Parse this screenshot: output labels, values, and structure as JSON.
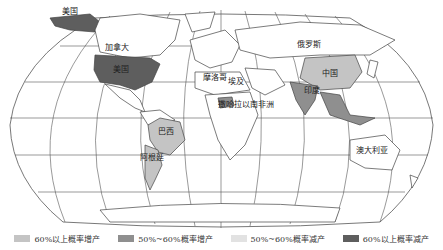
{
  "map": {
    "projection": "Robinson-like world map with graticule",
    "labels": [
      {
        "id": "usa-alaska",
        "text": "美国",
        "x": 62,
        "y": 11
      },
      {
        "id": "canada",
        "text": "加拿大",
        "x": 105,
        "y": 49
      },
      {
        "id": "usa",
        "text": "美国",
        "x": 113,
        "y": 71
      },
      {
        "id": "russia",
        "text": "俄罗斯",
        "x": 298,
        "y": 45
      },
      {
        "id": "china",
        "text": "中国",
        "x": 330,
        "y": 75
      },
      {
        "id": "india",
        "text": "印度",
        "x": 312,
        "y": 92
      },
      {
        "id": "morocco",
        "text": "摩洛哥",
        "x": 203,
        "y": 79
      },
      {
        "id": "egypt",
        "text": "埃及",
        "x": 230,
        "y": 82
      },
      {
        "id": "sub-saharan-africa",
        "text": "撒哈拉以南非洲",
        "x": 245,
        "y": 108
      },
      {
        "id": "brazil",
        "text": "巴西",
        "x": 160,
        "y": 133
      },
      {
        "id": "argentina",
        "text": "阿根廷",
        "x": 143,
        "y": 159
      },
      {
        "id": "australia",
        "text": "澳大利亚",
        "x": 373,
        "y": 153
      }
    ],
    "colors": {
      "over60_increase": "#c4c4c4",
      "50to60_increase": "#8f8f8f",
      "50to60_decrease": "#e2e2e2",
      "over60_decrease": "#5e5e5e",
      "land_default": "#ffffff",
      "outline": "#444444",
      "graticule": "#555555"
    },
    "regions": [
      {
        "name": "美国",
        "category": "over60_decrease"
      },
      {
        "name": "加拿大",
        "category": "none"
      },
      {
        "name": "俄罗斯",
        "category": "none"
      },
      {
        "name": "中国",
        "category": "over60_increase"
      },
      {
        "name": "印度",
        "category": "50to60_increase"
      },
      {
        "name": "巴西",
        "category": "over60_increase"
      },
      {
        "name": "阿根廷",
        "category": "over60_increase"
      },
      {
        "name": "撒哈拉以南非洲",
        "category": "50to60_increase"
      },
      {
        "name": "东南亚",
        "category": "50to60_increase"
      }
    ]
  },
  "legend": [
    {
      "label": "60%以上概率增产",
      "color": "#c4c4c4"
    },
    {
      "label": "50%~60%概率增产",
      "color": "#8f8f8f"
    },
    {
      "label": "50%~60%概率减产",
      "color": "#e2e2e2"
    },
    {
      "label": "60%以上概率减产",
      "color": "#5e5e5e"
    }
  ]
}
